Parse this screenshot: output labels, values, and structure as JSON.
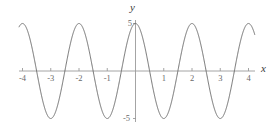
{
  "figure": {
    "background": "#ffffff",
    "curve_color": "#6e6e6e",
    "axis_color": "#9a9a9a",
    "tick_color": "#9a9a9a",
    "label_color": "#3a3a3a",
    "tick_label_color": "#6a6a6a",
    "x_axis_label": "x",
    "y_axis_label": "y"
  },
  "chart_data": {
    "type": "line",
    "title": "",
    "xlabel": "x",
    "ylabel": "y",
    "xlim": [
      -4.3,
      4.15
    ],
    "ylim": [
      -5.6,
      5.6
    ],
    "grid": false,
    "legend": null,
    "xticks": [
      -4,
      -3,
      -2,
      -1,
      1,
      2,
      3,
      4
    ],
    "xtick_labels": [
      "-4",
      "-3",
      "-2",
      "-1",
      "1",
      "2",
      "3",
      "4"
    ],
    "yticks": [
      5,
      -5
    ],
    "ytick_labels": [
      "5",
      "-5"
    ],
    "series": [
      {
        "name": "y = 5 cos(pi x)",
        "amplitude": 5,
        "period": 2,
        "function": "5*cos(pi*x)",
        "x": [
          -4,
          -3.75,
          -3.5,
          -3.25,
          -3,
          -2.75,
          -2.5,
          -2.25,
          -2,
          -1.75,
          -1.5,
          -1.25,
          -1,
          -0.75,
          -0.5,
          -0.25,
          0,
          0.25,
          0.5,
          0.75,
          1,
          1.25,
          1.5,
          1.75,
          2,
          2.25,
          2.5,
          2.75,
          3,
          3.25,
          3.5,
          3.75,
          4
        ],
        "y": [
          5,
          3.54,
          0,
          -3.54,
          -5,
          -3.54,
          0,
          3.54,
          5,
          3.54,
          0,
          -3.54,
          -5,
          -3.54,
          0,
          3.54,
          5,
          3.54,
          0,
          -3.54,
          -5,
          -3.54,
          0,
          3.54,
          5,
          3.54,
          0,
          -3.54,
          -5,
          -3.54,
          0,
          3.54,
          5
        ]
      }
    ],
    "maxima_at": [
      -4,
      -2,
      0,
      2,
      4
    ],
    "minima_at": [
      -3,
      -1,
      1,
      3
    ],
    "zeros_at": [
      -3.5,
      -2.5,
      -1.5,
      -0.5,
      0.5,
      1.5,
      2.5,
      3.5
    ]
  }
}
